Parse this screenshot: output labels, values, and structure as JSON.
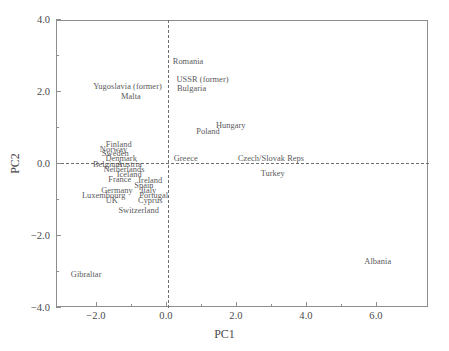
{
  "chart_data": {
    "type": "scatter",
    "title": "",
    "xlabel": "PC1",
    "ylabel": "PC2",
    "xlim": [
      -2.8,
      7.5
    ],
    "ylim": [
      -4.0,
      4.0
    ],
    "grid": false,
    "legend": null,
    "annotations": [
      {
        "label": "Romania",
        "x": 0.63,
        "y": 2.85,
        "anchor": "center"
      },
      {
        "label": "USSR (former)",
        "x": 0.3,
        "y": 2.34,
        "anchor": "left"
      },
      {
        "label": "Bulgaria",
        "x": 0.73,
        "y": 2.1,
        "anchor": "center"
      },
      {
        "label": "Yugoslavia (former)",
        "x": -1.1,
        "y": 2.14,
        "anchor": "center"
      },
      {
        "label": "Malta",
        "x": -1.0,
        "y": 1.87,
        "anchor": "center"
      },
      {
        "label": "Hungary",
        "x": 1.85,
        "y": 1.05,
        "anchor": "center"
      },
      {
        "label": "Poland",
        "x": 1.2,
        "y": 0.9,
        "anchor": "center"
      },
      {
        "label": "Finland",
        "x": -1.35,
        "y": 0.53,
        "anchor": "center"
      },
      {
        "label": "Norway",
        "x": -1.5,
        "y": 0.4,
        "anchor": "center"
      },
      {
        "label": "Sweden",
        "x": -1.45,
        "y": 0.27,
        "anchor": "center"
      },
      {
        "label": "Denmark",
        "x": -1.28,
        "y": 0.14,
        "anchor": "center"
      },
      {
        "label": "Greece",
        "x": 0.22,
        "y": 0.14,
        "anchor": "left"
      },
      {
        "label": "Czech/Slovak Reps",
        "x": 3.0,
        "y": 0.14,
        "anchor": "center"
      },
      {
        "label": "Belgium",
        "x": -1.67,
        "y": -0.02,
        "anchor": "center"
      },
      {
        "label": "Austria",
        "x": -1.05,
        "y": -0.02,
        "anchor": "center"
      },
      {
        "label": "Netherlands",
        "x": -1.2,
        "y": -0.17,
        "anchor": "center"
      },
      {
        "label": "Turkey",
        "x": 3.05,
        "y": -0.28,
        "anchor": "center"
      },
      {
        "label": "Iceland",
        "x": -1.05,
        "y": -0.3,
        "anchor": "center"
      },
      {
        "label": "France",
        "x": -1.32,
        "y": -0.44,
        "anchor": "center"
      },
      {
        "label": "Ireland",
        "x": -0.45,
        "y": -0.47,
        "anchor": "center"
      },
      {
        "label": "Spain",
        "x": -0.63,
        "y": -0.6,
        "anchor": "center"
      },
      {
        "label": "Germany",
        "x": -1.4,
        "y": -0.74,
        "anchor": "center"
      },
      {
        "label": "Italy",
        "x": -0.5,
        "y": -0.75,
        "anchor": "center"
      },
      {
        "label": "Luxembourg",
        "x": -1.78,
        "y": -0.88,
        "anchor": "center"
      },
      {
        "label": "Portugal",
        "x": -0.35,
        "y": -0.9,
        "anchor": "center"
      },
      {
        "label": "UK",
        "x": -1.55,
        "y": -1.02,
        "anchor": "center"
      },
      {
        "label": "Cyprus",
        "x": -0.45,
        "y": -1.04,
        "anchor": "center"
      },
      {
        "label": "Switzerland",
        "x": -0.78,
        "y": -1.3,
        "anchor": "center"
      },
      {
        "label": "Albania",
        "x": 6.05,
        "y": -2.72,
        "anchor": "center"
      },
      {
        "label": "Gibraltar",
        "x": -2.72,
        "y": -3.08,
        "anchor": "left"
      }
    ],
    "xticks": [
      {
        "value": -2.0,
        "label": "−2.0",
        "major": true
      },
      {
        "value": -1.0,
        "label": "",
        "major": false
      },
      {
        "value": 0.0,
        "label": "0.0",
        "major": true
      },
      {
        "value": 1.0,
        "label": "",
        "major": false
      },
      {
        "value": 2.0,
        "label": "2.0",
        "major": true
      },
      {
        "value": 3.0,
        "label": "",
        "major": false
      },
      {
        "value": 4.0,
        "label": "4.0",
        "major": true
      },
      {
        "value": 5.0,
        "label": "",
        "major": false
      },
      {
        "value": 6.0,
        "label": "6.0",
        "major": true
      }
    ],
    "yticks": [
      {
        "value": 4.0,
        "label": "4.0",
        "major": true
      },
      {
        "value": 3.0,
        "label": "",
        "major": false
      },
      {
        "value": 2.0,
        "label": "2.0",
        "major": true
      },
      {
        "value": 1.0,
        "label": "",
        "major": false
      },
      {
        "value": 0.0,
        "label": "0.0",
        "major": true
      },
      {
        "value": -1.0,
        "label": "",
        "major": false
      },
      {
        "value": -2.0,
        "label": "−2.0",
        "major": true
      },
      {
        "value": -3.0,
        "label": "",
        "major": false
      },
      {
        "value": -4.0,
        "label": "−4.0",
        "major": true
      }
    ],
    "reference_lines": [
      {
        "orientation": "horizontal",
        "value": 0.0,
        "style": "dashed"
      },
      {
        "orientation": "vertical",
        "value": 0.05,
        "style": "dashed"
      }
    ]
  },
  "colors": {
    "frame": "#8d8d8d",
    "text": "#4a4a4a",
    "label_text": "#5a5a5a",
    "reference_line": "#6f6f6f",
    "background": "#ffffff"
  }
}
